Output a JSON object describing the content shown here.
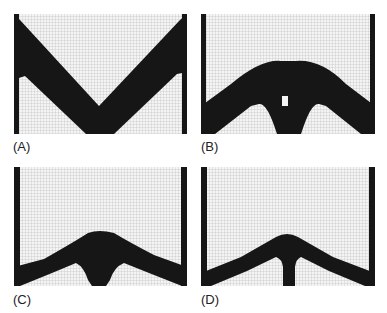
{
  "figure": {
    "panels": [
      {
        "id": "A",
        "label": "(A)",
        "description": "Topology optimization result: V-shaped structure with two diagonal bars meeting at bottom center"
      },
      {
        "id": "B",
        "label": "(B)",
        "description": "Topology optimization result: arch with two legs and small central hole"
      },
      {
        "id": "C",
        "label": "(C)",
        "description": "Topology optimization result: low arch with short central support"
      },
      {
        "id": "D",
        "label": "(D)",
        "description": "Topology optimization result: low arch with thin vertical central column"
      }
    ],
    "colors": {
      "material": "#161616",
      "void": "#f4f4f4",
      "grid": "#b8b8b8"
    }
  }
}
